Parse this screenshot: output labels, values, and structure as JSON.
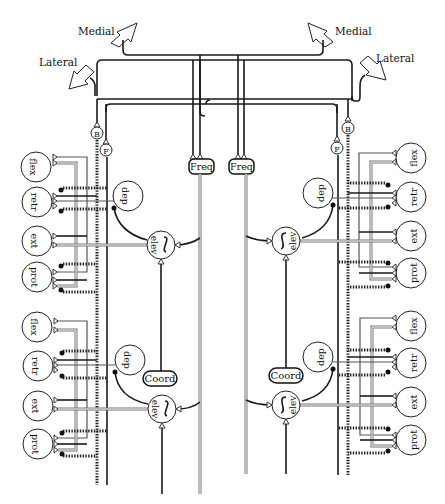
{
  "diagram": {
    "title": "",
    "colors": {
      "ink": "#1a1a1a",
      "paper": "#ffffff",
      "grey_wire": "#777777"
    },
    "direction_labels": {
      "left_medial": "Medial",
      "left_lateral": "Lateral",
      "right_medial": "Medial",
      "right_lateral": "Lateral"
    },
    "command_nodes": {
      "B_left": "B",
      "F_left": "F",
      "B_right": "B",
      "F_right": "F"
    },
    "frequency_nodes": [
      "Freq",
      "Freq"
    ],
    "coord_nodes": [
      "Coord",
      "Coord"
    ],
    "modules": [
      {
        "id": "left-front",
        "side": "left",
        "motor_neurons": [
          "flex",
          "retr",
          "ext",
          "prot"
        ],
        "interneurons": {
          "depressor": "dep",
          "elevator": "elev"
        },
        "oscillator_symbol": "~"
      },
      {
        "id": "left-rear",
        "side": "left",
        "motor_neurons": [
          "flex",
          "retr",
          "ext",
          "prot"
        ],
        "interneurons": {
          "depressor": "dep",
          "elevator": "elev"
        },
        "oscillator_symbol": "~"
      },
      {
        "id": "right-front",
        "side": "right",
        "motor_neurons": [
          "flex",
          "retr",
          "ext",
          "prot"
        ],
        "interneurons": {
          "depressor": "dep",
          "elevator": "elev"
        },
        "oscillator_symbol": "~"
      },
      {
        "id": "right-rear",
        "side": "right",
        "motor_neurons": [
          "flex",
          "retr",
          "ext",
          "prot"
        ],
        "interneurons": {
          "depressor": "dep",
          "elevator": "elev"
        },
        "oscillator_symbol": "~"
      }
    ],
    "legend_symbols": {
      "excitatory_synapse": "open-triangle",
      "inhibitory_synapse": "filled-circle"
    }
  }
}
